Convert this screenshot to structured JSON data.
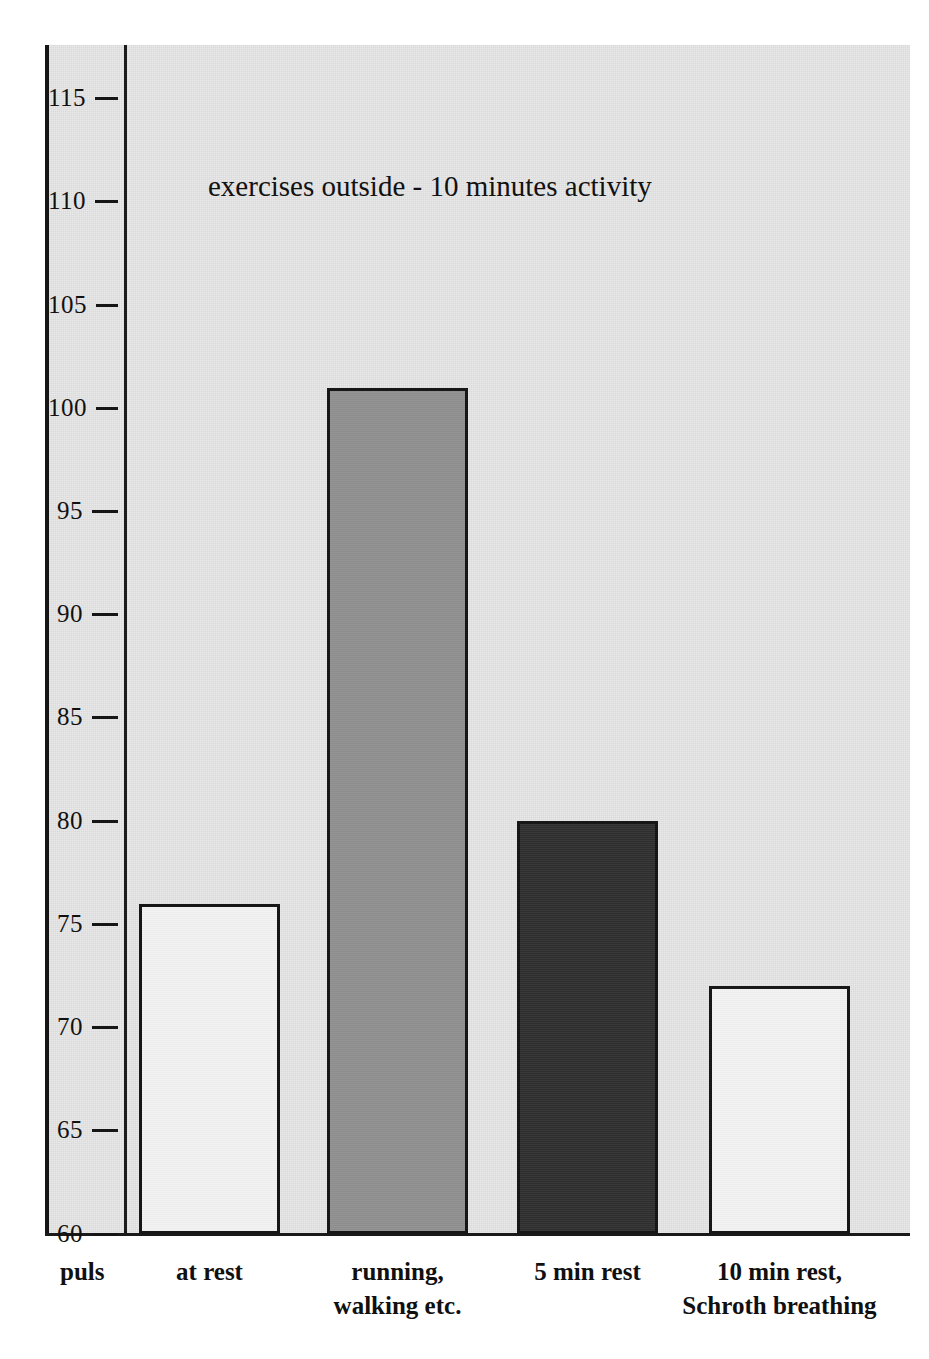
{
  "chart_data": {
    "type": "bar",
    "title": "exercises outside - 10 minutes activity",
    "xlabel": "",
    "ylabel": "puls",
    "ylim": [
      60,
      118
    ],
    "grid": false,
    "legend": "none",
    "yticks": [
      115,
      110,
      105,
      100,
      95,
      90,
      85,
      80,
      75,
      70,
      65,
      60
    ],
    "ytick_labels": [
      "115",
      "110",
      "105",
      "100",
      "95",
      "90",
      "85",
      "80",
      "75",
      "70",
      "65",
      "60"
    ],
    "categories": [
      "at rest",
      "running, walking etc.",
      "5 min rest",
      "10 min rest, Schroth breathing"
    ],
    "values": [
      76,
      101,
      80,
      72
    ],
    "bar_colors": [
      "#f2f2f2",
      "#8d8d8d",
      "#2e2e2e",
      "#f2f2f2"
    ],
    "bar_edge_color": "#171717",
    "panel_color": "#e9e9e9"
  },
  "axis": {
    "y_label_text": "puls",
    "ticks": [
      {
        "value": 115,
        "label": "115"
      },
      {
        "value": 110,
        "label": "110"
      },
      {
        "value": 105,
        "label": "105"
      },
      {
        "value": 100,
        "label": "100"
      },
      {
        "value": 95,
        "label": "95"
      },
      {
        "value": 90,
        "label": "90"
      },
      {
        "value": 85,
        "label": "85"
      },
      {
        "value": 80,
        "label": "80"
      },
      {
        "value": 75,
        "label": "75"
      },
      {
        "value": 70,
        "label": "70"
      },
      {
        "value": 65,
        "label": "65"
      },
      {
        "value": 60,
        "label": "60"
      }
    ]
  },
  "title": {
    "text": "exercises outside - 10 minutes activity"
  },
  "bars": [
    {
      "label_line1": "at rest",
      "label_line2": "",
      "value": 76,
      "style": "fill-white"
    },
    {
      "label_line1": "running,",
      "label_line2": "walking etc.",
      "value": 101,
      "style": "fill-grey"
    },
    {
      "label_line1": "5 min rest",
      "label_line2": "",
      "value": 80,
      "style": "fill-dark"
    },
    {
      "label_line1": "10 min rest,",
      "label_line2": "Schroth breathing",
      "value": 72,
      "style": "fill-white"
    }
  ]
}
